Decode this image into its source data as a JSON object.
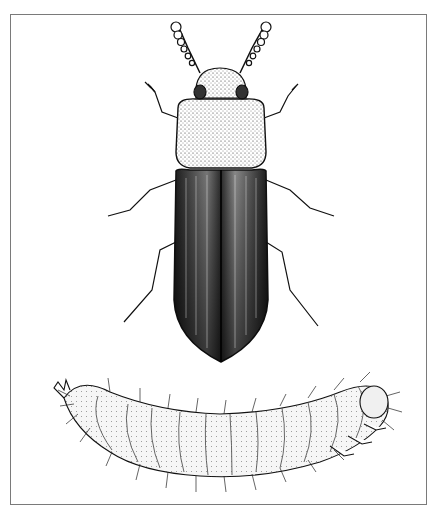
{
  "illustration": {
    "style": "black-and-white stipple pen illustration",
    "frame_color": "#7a7a7a",
    "ink_color": "#111111",
    "subjects": [
      {
        "name": "adult beetle",
        "view": "dorsal",
        "position": "top"
      },
      {
        "name": "larva",
        "view": "lateral",
        "position": "bottom"
      }
    ]
  }
}
